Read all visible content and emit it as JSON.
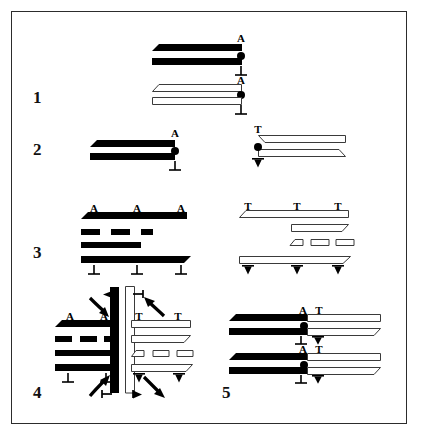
{
  "figure": {
    "background_color": "#ffffff",
    "border_color": "#2c2c2c",
    "ink_color": "#000000",
    "outline_color": "#3a3a3a",
    "width": 421,
    "height": 437
  },
  "symbols": {
    "a_label": "A",
    "t_label": "T",
    "perp_up": "⊥",
    "perp_down": "⊻",
    "dot": "●"
  },
  "panels": [
    {
      "id": "panel-1",
      "number": "1",
      "number_pos": {
        "x": 33,
        "y": 89
      },
      "description": "Two stacked black beveled bar pairs above two stacked white beveled bar pairs, each pair marked A over a dot over perpendicular.",
      "groups": [
        {
          "id": "p1-black-pair",
          "fill": "black",
          "markers_top": [
            "A"
          ],
          "markers_mid": [
            "dot"
          ],
          "markers_bottom": [
            "⊥"
          ]
        },
        {
          "id": "p1-white-pair",
          "fill": "white",
          "markers_top": [
            "A"
          ],
          "markers_mid": [
            "dot"
          ],
          "markers_bottom": [
            "⊥"
          ]
        }
      ]
    },
    {
      "id": "panel-2",
      "number": "2",
      "number_pos": {
        "x": 33,
        "y": 148
      },
      "description": "Left: black bar pair with A, dot, perpendicular at right end. Right: white bar pair mirrored with T, dot, inverted perpendicular at left end.",
      "groups": [
        {
          "id": "p2-black-pair",
          "fill": "black",
          "markers_top": [
            "A"
          ],
          "markers_mid": [
            "dot"
          ],
          "markers_bottom": [
            "⊥"
          ]
        },
        {
          "id": "p2-white-pair",
          "fill": "white",
          "markers_top": [
            "T"
          ],
          "markers_mid": [
            "dot"
          ],
          "markers_bottom": [
            "⊻"
          ]
        }
      ]
    },
    {
      "id": "panel-3",
      "number": "3",
      "number_pos": {
        "x": 33,
        "y": 253
      },
      "description": "Left: black four-row stack, top row labelled A A A, bottom row labelled perpendicular three times, with fragmented middle rows. Right: white mirrored stack labelled T T T on top and inverted perpendicular three times below.",
      "groups": [
        {
          "id": "p3-black-stack",
          "fill": "black",
          "markers_top": [
            "A",
            "A",
            "A"
          ],
          "markers_bottom": [
            "⊥",
            "⊥",
            "⊥"
          ]
        },
        {
          "id": "p3-white-stack",
          "fill": "white",
          "markers_top": [
            "T",
            "T",
            "T"
          ],
          "markers_bottom": [
            "⊻",
            "⊻",
            "⊻"
          ]
        }
      ]
    },
    {
      "id": "panel-4",
      "number": "4",
      "number_pos": {
        "x": 33,
        "y": 388
      },
      "description": "Four quadrant composite joining the black and white stacks about a vertical elbow pair, with four curved rotation arrows and small tick markers.",
      "groups": [
        {
          "id": "p4-q-top-left",
          "fill": "black",
          "markers_top": [
            "A",
            "A"
          ]
        },
        {
          "id": "p4-q-top-right",
          "fill": "white",
          "markers_top": [
            "T",
            "T"
          ]
        },
        {
          "id": "p4-q-bottom-left",
          "fill": "black",
          "markers_bottom": [
            "⊥",
            "⊥"
          ]
        },
        {
          "id": "p4-q-bottom-right",
          "fill": "white",
          "markers_bottom": [
            "⊻",
            "⊻"
          ]
        }
      ],
      "arrows": 4,
      "ticks": 4
    },
    {
      "id": "panel-5",
      "number": "5",
      "number_pos": {
        "x": 228,
        "y": 388
      },
      "description": "Two composite rows, each a black bar pair on the left butt-joined to a white bar pair on the right; junction markers A and T above, perpendicular and inverted perpendicular below.",
      "groups": [
        {
          "id": "p5-row-1",
          "markers_top": [
            "A",
            "T"
          ],
          "markers_mid": [
            "dot"
          ],
          "markers_bottom": [
            "⊥",
            "⊻"
          ]
        },
        {
          "id": "p5-row-2",
          "markers_top": [
            "A",
            "T"
          ],
          "markers_mid": [
            "dot"
          ],
          "markers_bottom": [
            "⊥",
            "⊻"
          ]
        }
      ]
    }
  ],
  "labels": {
    "p1_a_top": "A",
    "p1_perp_top": "⊥",
    "p1_a_bot": "A",
    "p1_perp_bot": "⊥",
    "p2_a": "A",
    "p2_perp": "⊥",
    "p2_t": "T",
    "p2_vperp": "⊻",
    "p3_a1": "A",
    "p3_a2": "A",
    "p3_a3": "A",
    "p3_p1": "⊥",
    "p3_p2": "⊥",
    "p3_p3": "⊥",
    "p3_t1": "T",
    "p3_t2": "T",
    "p3_t3": "T",
    "p3_v1": "⊻",
    "p3_v2": "⊻",
    "p3_v3": "⊻",
    "p4_a1": "A",
    "p4_a2": "A",
    "p4_t1": "T",
    "p4_t2": "T",
    "p4_p1": "⊥",
    "p4_p2": "⊥",
    "p4_v1": "⊻",
    "p4_v2": "⊻",
    "p5_a1": "A",
    "p5_t1": "T",
    "p5_p1": "⊥",
    "p5_v1": "⊻",
    "p5_a2": "A",
    "p5_t2": "T",
    "p5_p2": "⊥",
    "p5_v2": "⊻",
    "num1": "1",
    "num2": "2",
    "num3": "3",
    "num4": "4",
    "num5": "5"
  }
}
